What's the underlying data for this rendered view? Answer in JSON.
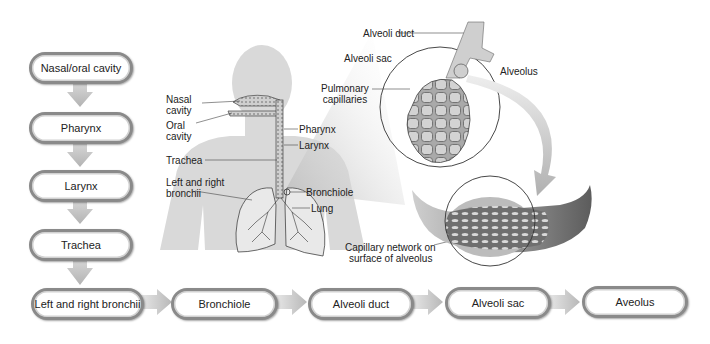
{
  "flow": {
    "vertical_steps": [
      {
        "label": "Nasal/oral cavity"
      },
      {
        "label": "Pharynx"
      },
      {
        "label": "Larynx"
      },
      {
        "label": "Trachea"
      }
    ],
    "horizontal_steps": [
      {
        "label": "Left and right bronchii"
      },
      {
        "label": "Bronchiole"
      },
      {
        "label": "Alveoli duct"
      },
      {
        "label": "Alveoli sac"
      },
      {
        "label": "Aveolus"
      }
    ]
  },
  "anatomy_labels": {
    "nasal_cavity": "Nasal\ncavity",
    "nasal_cavity_l1": "Nasal",
    "nasal_cavity_l2": "cavity",
    "oral_cavity_l1": "Oral",
    "oral_cavity_l2": "cavity",
    "trachea": "Trachea",
    "bronchii_l1": "Left and right",
    "bronchii_l2": "bronchii",
    "pharynx": "Pharynx",
    "larynx": "Larynx",
    "bronchiole": "Bronchiole",
    "lung": "Lung"
  },
  "alveoli_labels": {
    "alveoli_duct": "Alveoli duct",
    "alveoli_sac": "Alveoli sac",
    "alveolus": "Alveolus",
    "pulmonary_l1": "Pulmonary",
    "pulmonary_l2": "capillaries",
    "capillary_l1": "Capillary network on",
    "capillary_l2": "surface of alveolus"
  },
  "colors": {
    "pill_border": "#8a8a8a",
    "arrow": "#c4c4c4",
    "body_silhouette": "#d9d9d9",
    "network_dark": "#6e6e6e",
    "network_light": "#b5b5b5"
  }
}
